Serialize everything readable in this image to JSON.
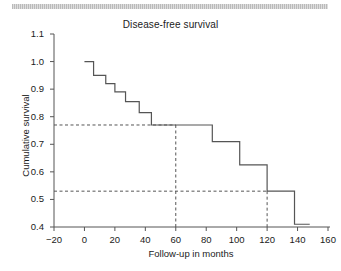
{
  "figure": {
    "decor_bar": "gray-hatched-rule"
  },
  "chart_data": {
    "type": "line",
    "subtype": "kaplan-meier-step",
    "title": "Disease-free survival",
    "xlabel": "Follow-up in months",
    "ylabel": "Cumulative survival",
    "xlim": [
      -20,
      160
    ],
    "ylim": [
      0.4,
      1.1
    ],
    "xticks": [
      -20,
      0,
      20,
      40,
      60,
      80,
      100,
      120,
      140,
      160
    ],
    "xtick_labels": [
      "−20",
      "0",
      "20",
      "40",
      "60",
      "80",
      "100",
      "120",
      "140",
      "160"
    ],
    "yticks": [
      0.4,
      0.5,
      0.6,
      0.7,
      0.8,
      0.9,
      1.0,
      1.1
    ],
    "ytick_labels": [
      "0.4",
      "0.5",
      "0.6",
      "0.7",
      "0.8",
      "0.9",
      "1.0",
      "1.1"
    ],
    "grid": false,
    "legend": null,
    "series": [
      {
        "name": "Disease-free survival",
        "color": "#555555",
        "step_points": [
          {
            "x": 0,
            "y": 1.0
          },
          {
            "x": 6,
            "y": 1.0
          },
          {
            "x": 6,
            "y": 0.95
          },
          {
            "x": 14,
            "y": 0.95
          },
          {
            "x": 14,
            "y": 0.92
          },
          {
            "x": 20,
            "y": 0.92
          },
          {
            "x": 20,
            "y": 0.89
          },
          {
            "x": 27,
            "y": 0.89
          },
          {
            "x": 27,
            "y": 0.855
          },
          {
            "x": 36,
            "y": 0.855
          },
          {
            "x": 36,
            "y": 0.815
          },
          {
            "x": 44,
            "y": 0.815
          },
          {
            "x": 44,
            "y": 0.77
          },
          {
            "x": 84,
            "y": 0.77
          },
          {
            "x": 84,
            "y": 0.71
          },
          {
            "x": 102,
            "y": 0.71
          },
          {
            "x": 102,
            "y": 0.625
          },
          {
            "x": 120,
            "y": 0.625
          },
          {
            "x": 120,
            "y": 0.53
          },
          {
            "x": 138,
            "y": 0.53
          },
          {
            "x": 138,
            "y": 0.41
          },
          {
            "x": 148,
            "y": 0.41
          }
        ]
      }
    ],
    "annotations": [
      {
        "type": "reference-lines",
        "style": "dashed",
        "color": "#555555",
        "label": "5-year survival",
        "x": 60,
        "y": 0.77
      },
      {
        "type": "reference-lines",
        "style": "dashed",
        "color": "#555555",
        "label": "10-year survival",
        "x": 120,
        "y": 0.53
      }
    ]
  }
}
